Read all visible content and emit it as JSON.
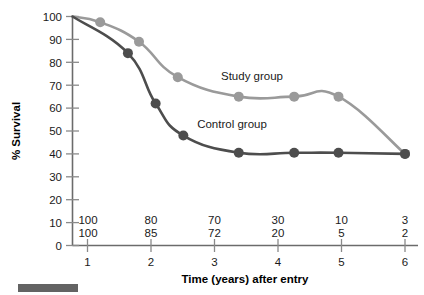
{
  "chart_data": {
    "type": "line",
    "title": "",
    "xlabel": "Time (years) after entry",
    "ylabel": "% Survival",
    "xlim": [
      0,
      6.35
    ],
    "ylim": [
      0,
      100
    ],
    "xticks": [
      "1",
      "2",
      "3",
      "4",
      "5",
      "6"
    ],
    "xtick_values": [
      1,
      2,
      3,
      4,
      5,
      6
    ],
    "yticks": [
      "0",
      "10",
      "20",
      "30",
      "40",
      "50",
      "60",
      "70",
      "80",
      "90",
      "100"
    ],
    "ytick_values": [
      0,
      10,
      20,
      30,
      40,
      50,
      60,
      70,
      80,
      90,
      100
    ],
    "grid": false,
    "legend_position": "inline-annotation",
    "series": [
      {
        "name": "Study group",
        "color": "#9a9a9a",
        "marker": "circle",
        "annotation": "Study group",
        "annotation_x": 3.55,
        "annotation_y": 76,
        "x": [
          0,
          0.5,
          1.2,
          1.9,
          3.0,
          4.0,
          4.8,
          6.0
        ],
        "y": [
          100,
          97.5,
          89,
          73.5,
          65,
          65,
          65,
          40
        ]
      },
      {
        "name": "Control group",
        "color": "#4d4d4d",
        "marker": "circle",
        "annotation": "Control group",
        "annotation_x": 3.0,
        "annotation_y": 50,
        "x": [
          0,
          1.0,
          1.5,
          2.0,
          3.0,
          4.0,
          4.8,
          6.0
        ],
        "y": [
          100,
          84,
          62,
          48,
          40.5,
          40.5,
          40.5,
          40
        ]
      }
    ],
    "at_risk_table": {
      "rows": [
        {
          "series": "Study group",
          "values": [
            "100",
            "80",
            "70",
            "30",
            "10",
            "3"
          ]
        },
        {
          "series": "Control group",
          "values": [
            "100",
            "85",
            "72",
            "20",
            "5",
            "2"
          ]
        }
      ],
      "columns": [
        1,
        2,
        3,
        4,
        5,
        6
      ]
    }
  },
  "figure": {
    "footer_bar_color": "#636363"
  }
}
